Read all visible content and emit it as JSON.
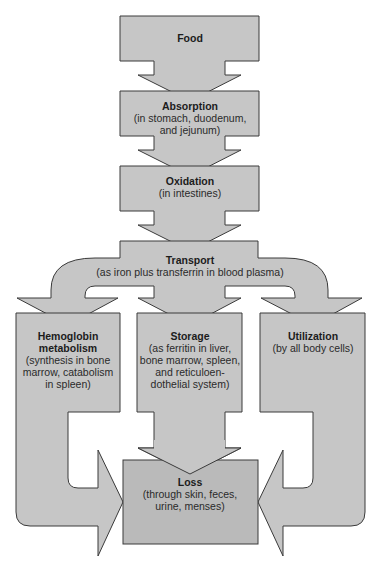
{
  "diagram": {
    "type": "flowchart",
    "nodes": {
      "food": {
        "title": [
          "Food"
        ],
        "desc": []
      },
      "absorption": {
        "title": [
          "Absorption"
        ],
        "desc": [
          "(in stomach, duodenum,",
          "and jejunum)"
        ]
      },
      "oxidation": {
        "title": [
          "Oxidation"
        ],
        "desc": [
          "(in intestines)"
        ]
      },
      "transport": {
        "title": [
          "Transport"
        ],
        "desc": [
          "(as iron plus transferrin in blood plasma)"
        ]
      },
      "hemoglobin": {
        "title": [
          "Hemoglobin",
          "metabolism"
        ],
        "desc": [
          "(synthesis in bone",
          "marrow, catabolism",
          "in spleen)"
        ]
      },
      "storage": {
        "title": [
          "Storage"
        ],
        "desc": [
          "(as ferritin in liver,",
          "bone marrow, spleen,",
          "and reticuloen-",
          "dothelial system)"
        ]
      },
      "utilization": {
        "title": [
          "Utilization"
        ],
        "desc": [
          "(by all body cells)"
        ]
      },
      "loss": {
        "title": [
          "Loss"
        ],
        "desc": [
          "(through skin, feces,",
          "urine, menses)"
        ]
      }
    },
    "edges": [
      {
        "from": "food",
        "to": "absorption"
      },
      {
        "from": "absorption",
        "to": "oxidation"
      },
      {
        "from": "oxidation",
        "to": "transport"
      },
      {
        "from": "transport",
        "to": "hemoglobin"
      },
      {
        "from": "transport",
        "to": "storage"
      },
      {
        "from": "transport",
        "to": "utilization"
      },
      {
        "from": "hemoglobin",
        "to": "loss"
      },
      {
        "from": "storage",
        "to": "loss"
      },
      {
        "from": "utilization",
        "to": "loss"
      }
    ],
    "colors": {
      "fill": "#c6c6c6",
      "loss_fill": "#bababa",
      "stroke": "#3a3a3a",
      "text": "#1c1c1c"
    }
  }
}
